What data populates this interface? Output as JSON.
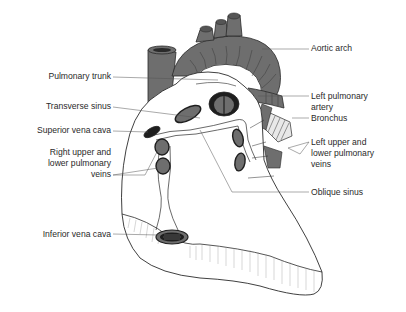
{
  "diagram": {
    "colors": {
      "vessel_fill": "#6e6e6e",
      "vessel_dark": "#1e1e1e",
      "outline": "#2a2a2a",
      "leader_line": "#555555",
      "text": "#2a2a2a",
      "background": "#ffffff"
    },
    "labels": {
      "aortic_arch": "Aortic arch",
      "pulmonary_trunk": "Pulmonary trunk",
      "left_pulmonary_artery": "Left pulmonary\nartery",
      "bronchus": "Bronchus",
      "transverse_sinus": "Transverse sinus",
      "superior_vena_cava": "Superior vena cava",
      "right_pulmonary_veins": "Right upper and\nlower pulmonary\nveins",
      "left_pulmonary_veins": "Left upper and\nlower pulmonary\nveins",
      "oblique_sinus": "Oblique sinus",
      "inferior_vena_cava": "Inferior vena cava"
    }
  }
}
